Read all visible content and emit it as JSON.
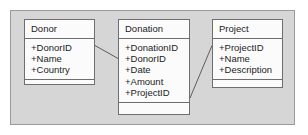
{
  "diagram": {
    "type": "uml-class-diagram",
    "background_color": "#d6d6d6",
    "box_fill_color": "#fbfbfb",
    "box_border_color": "#6e6e6e",
    "connector_color": "#5d5d5d",
    "classes": [
      {
        "id": "donor",
        "name": "Donor",
        "attributes": [
          "+DonorID",
          "+Name",
          "+Country"
        ],
        "operations": []
      },
      {
        "id": "donation",
        "name": "Donation",
        "attributes": [
          "+DonationID",
          "+DonorID",
          "+Date",
          "+Amount",
          "+ProjectID"
        ],
        "operations": []
      },
      {
        "id": "project",
        "name": "Project",
        "attributes": [
          "+ProjectID",
          "+Name",
          "+Description"
        ],
        "operations": []
      }
    ],
    "associations": [
      {
        "id": "donor-donation",
        "from": "donor",
        "to": "donation",
        "label": ""
      },
      {
        "id": "donation-project",
        "from": "donation",
        "to": "project",
        "label": ""
      }
    ]
  }
}
